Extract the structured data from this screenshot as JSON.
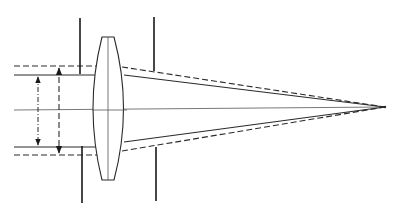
{
  "diagram": {
    "type": "optical-ray-diagram",
    "colors": {
      "line": "#2a2a2a",
      "stop": "#1a1a1a",
      "background": "#ffffff"
    },
    "optical_axis": {
      "x1": 14,
      "y": 110,
      "x2": 385
    },
    "focal_point": {
      "x": 385,
      "y": 107
    },
    "lens": {
      "top_y": 37,
      "bottom_y": 180,
      "flat_left_x": 102,
      "flat_right_x": 114,
      "max_left_x": 92,
      "max_right_x": 127,
      "center_x": 108
    },
    "stops": [
      {
        "name": "front-stop-upper",
        "x": 80,
        "y1": 18,
        "y2": 74
      },
      {
        "name": "front-stop-lower",
        "x": 82,
        "y1": 146,
        "y2": 203
      },
      {
        "name": "rear-stop-upper",
        "x": 154,
        "y1": 17,
        "y2": 71
      },
      {
        "name": "rear-stop-lower",
        "x": 156,
        "y1": 147,
        "y2": 201
      }
    ],
    "beams": {
      "solid": {
        "upper_y": 75,
        "lower_y": 147,
        "exit_upper_y": 75,
        "exit_lower_y": 142
      },
      "dashed": {
        "upper_y": 66,
        "lower_y": 155,
        "exit_upper_y": 67,
        "exit_lower_y": 151
      }
    },
    "dimension_arrows": [
      {
        "name": "solid-beam-diameter",
        "x": 38,
        "y1": 75,
        "y2": 147,
        "style": "dash-dot"
      },
      {
        "name": "dashed-beam-diameter",
        "x": 59,
        "y1": 66,
        "y2": 155,
        "style": "dashed"
      }
    ]
  }
}
